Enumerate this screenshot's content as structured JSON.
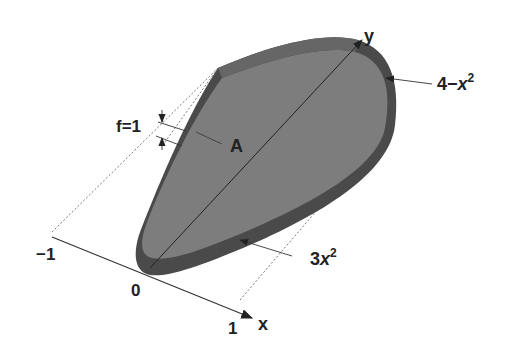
{
  "diagram": {
    "labels": {
      "y_axis": "y",
      "x_axis": "x",
      "upper_curve": "4−",
      "upper_curve_var": "x",
      "upper_curve_exp": "2",
      "lower_curve_coef": "3",
      "lower_curve_var": "x",
      "lower_curve_exp": "2",
      "thickness": "f=1",
      "area": "A",
      "tick_neg1": "−1",
      "tick_0": "0",
      "tick_1": "1"
    },
    "colors": {
      "top_face": "#7d7d7d",
      "side_dark": "#4a4a4a",
      "side_mid": "#666666",
      "line": "#333333",
      "dotted": "#555555",
      "text": "#222222"
    }
  }
}
